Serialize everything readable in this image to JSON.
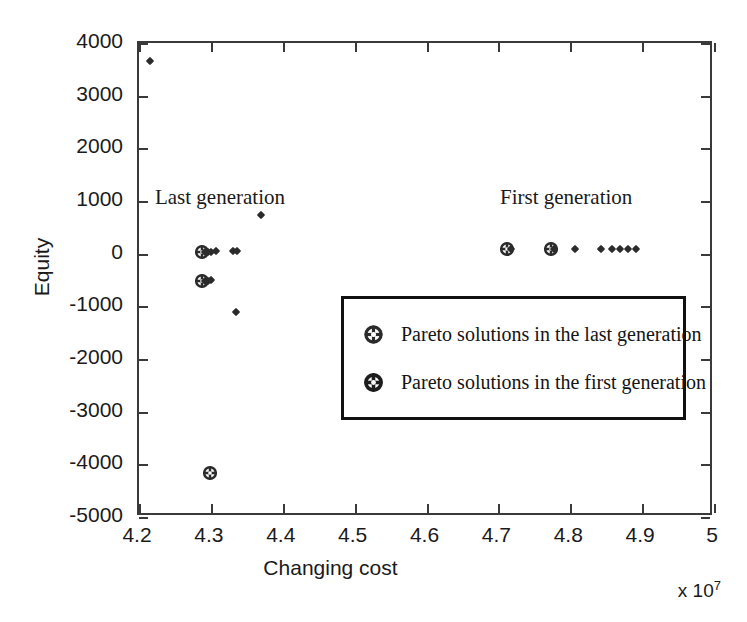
{
  "figure": {
    "xlabel": "Changing cost",
    "ylabel": "Equity",
    "exponent_prefix": "x 10",
    "exponent_power": "7",
    "annotations": [
      {
        "text": "Last generation",
        "x": 4.225,
        "y": 1000
      },
      {
        "text": "First generation",
        "x": 4.705,
        "y": 1000
      }
    ]
  },
  "legend": {
    "entries": [
      {
        "label": "Pareto solutions in the last generation",
        "marker": "circle-cross-icon"
      },
      {
        "label": "Pareto solutions in the first generation",
        "marker": "circle-cross-icon"
      }
    ]
  },
  "axes": {
    "x_ticks": [
      "4.2",
      "4.3",
      "4.4",
      "4.5",
      "4.6",
      "4.7",
      "4.8",
      "4.9",
      "5"
    ],
    "x_tick_values": [
      4.2,
      4.3,
      4.4,
      4.5,
      4.6,
      4.7,
      4.8,
      4.9,
      5.0
    ],
    "y_ticks": [
      "4000",
      "3000",
      "2000",
      "1000",
      "0",
      "-1000",
      "-2000",
      "-3000",
      "-4000",
      "-5000"
    ],
    "y_tick_values": [
      4000,
      3000,
      2000,
      1000,
      0,
      -1000,
      -2000,
      -3000,
      -4000,
      -5000
    ],
    "xlim": [
      4.2,
      5.0
    ],
    "ylim": [
      -5000,
      4000
    ]
  },
  "chart_data": {
    "type": "scatter",
    "title": "",
    "xlabel": "Changing cost",
    "ylabel": "Equity",
    "x_scale_note": "x 10^7",
    "xlim": [
      4.2,
      5.0
    ],
    "ylim": [
      -5000,
      4000
    ],
    "grid": false,
    "legend_position": "center-right-inside",
    "series": [
      {
        "name": "Pareto solutions in the last generation",
        "marker": "circle-cross",
        "points": [
          {
            "x": 4.2905,
            "y": 0
          },
          {
            "x": 4.2905,
            "y": -550
          },
          {
            "x": 4.301,
            "y": -4200
          }
        ]
      },
      {
        "name": "Pareto solutions in the first generation",
        "marker": "circle-cross",
        "points": [
          {
            "x": 4.7145,
            "y": 60
          },
          {
            "x": 4.776,
            "y": 60
          }
        ]
      },
      {
        "name": "Last generation cloud",
        "marker": "small-diamond",
        "points": [
          {
            "x": 4.295,
            "y": 0
          },
          {
            "x": 4.2985,
            "y": 0
          },
          {
            "x": 4.3025,
            "y": 0
          },
          {
            "x": 4.31,
            "y": 20
          },
          {
            "x": 4.333,
            "y": 20
          },
          {
            "x": 4.3395,
            "y": 20
          },
          {
            "x": 4.2945,
            "y": -550
          },
          {
            "x": 4.2985,
            "y": -550
          },
          {
            "x": 4.303,
            "y": -540
          },
          {
            "x": 4.218,
            "y": 3620
          },
          {
            "x": 4.372,
            "y": 700
          },
          {
            "x": 4.338,
            "y": -1150
          }
        ]
      },
      {
        "name": "First generation cloud",
        "marker": "small-diamond",
        "points": [
          {
            "x": 4.72,
            "y": 60
          },
          {
            "x": 4.78,
            "y": 60
          },
          {
            "x": 4.8095,
            "y": 60
          },
          {
            "x": 4.8455,
            "y": 60
          },
          {
            "x": 4.8605,
            "y": 60
          },
          {
            "x": 4.872,
            "y": 60
          },
          {
            "x": 4.883,
            "y": 60
          },
          {
            "x": 4.894,
            "y": 60
          }
        ]
      }
    ]
  },
  "colors": {
    "marker": "#2b2b2b",
    "frame": "#3a3a3a",
    "legend_border": "#111111",
    "text": "#1a1a1a",
    "background": "#ffffff"
  }
}
